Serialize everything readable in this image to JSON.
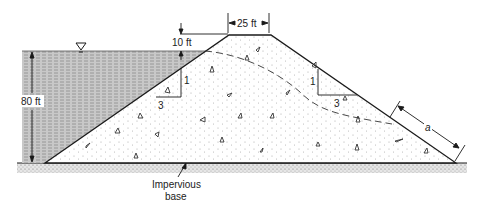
{
  "diagram": {
    "labels": {
      "crest_width": "25 ft",
      "freeboard": "10 ft",
      "water_depth": "80 ft",
      "upstream_slope_v": "1",
      "upstream_slope_h": "3",
      "downstream_slope_v": "1",
      "downstream_slope_h": "3",
      "seepage_length": "a",
      "base_line1": "Impervious",
      "base_line2": "base"
    },
    "symbols": {
      "water_surface": "water-surface-triangle-icon"
    },
    "colors": {
      "line": "#1a1a1a",
      "water_fill": "#bdbdbd",
      "dam_fill": "#ffffff",
      "dot": "#9a9a9a"
    }
  }
}
